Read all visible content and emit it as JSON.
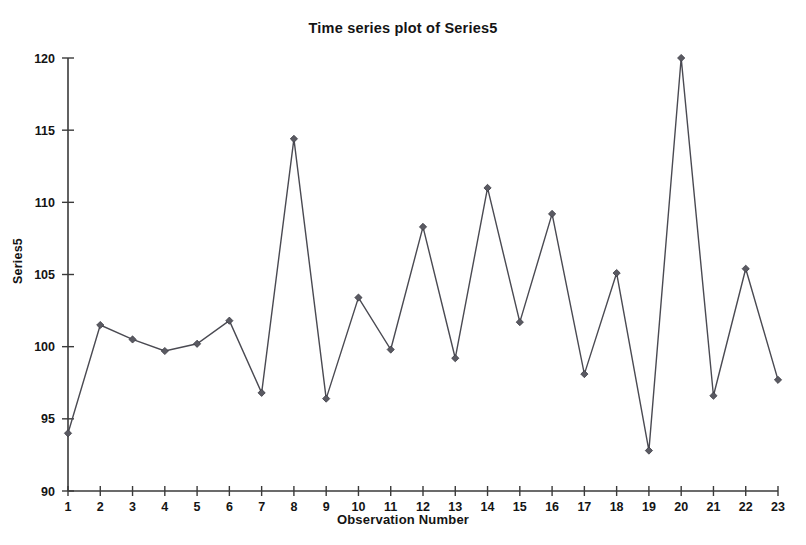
{
  "chart_data": {
    "type": "line",
    "title": "Time series plot of Series5",
    "xlabel": "Observation Number",
    "ylabel": "Series5",
    "x": [
      1,
      2,
      3,
      4,
      5,
      6,
      7,
      8,
      9,
      10,
      11,
      12,
      13,
      14,
      15,
      16,
      17,
      18,
      19,
      20,
      21,
      22,
      23
    ],
    "values": [
      94.0,
      101.5,
      100.5,
      99.7,
      100.2,
      101.8,
      96.8,
      114.4,
      96.4,
      103.4,
      99.8,
      108.3,
      99.2,
      111.0,
      101.7,
      109.2,
      98.1,
      105.1,
      92.8,
      120.0,
      96.6,
      105.4,
      97.7
    ],
    "series": [
      {
        "name": "Series5",
        "values": [
          94.0,
          101.5,
          100.5,
          99.7,
          100.2,
          101.8,
          96.8,
          114.4,
          96.4,
          103.4,
          99.8,
          108.3,
          99.2,
          111.0,
          101.7,
          109.2,
          98.1,
          105.1,
          92.8,
          120.0,
          96.6,
          105.4,
          97.7
        ]
      }
    ],
    "xlim": [
      1,
      23
    ],
    "ylim": [
      90,
      120
    ],
    "ytick_labels": [
      "90",
      "95",
      "100",
      "105",
      "110",
      "115",
      "120"
    ],
    "yticks": [
      90,
      95,
      100,
      105,
      110,
      115,
      120
    ],
    "xtick_labels": [
      "1",
      "2",
      "3",
      "4",
      "5",
      "6",
      "7",
      "8",
      "9",
      "10",
      "11",
      "12",
      "13",
      "14",
      "15",
      "16",
      "17",
      "18",
      "19",
      "20",
      "21",
      "22",
      "23"
    ],
    "xticks": [
      1,
      2,
      3,
      4,
      5,
      6,
      7,
      8,
      9,
      10,
      11,
      12,
      13,
      14,
      15,
      16,
      17,
      18,
      19,
      20,
      21,
      22,
      23
    ],
    "grid": false,
    "legend": null,
    "marker": "diamond",
    "line_color": "#4a4a52",
    "marker_color": "#5a5a62",
    "axis_color": "#3a3a3a",
    "background_color": "#ffffff"
  }
}
